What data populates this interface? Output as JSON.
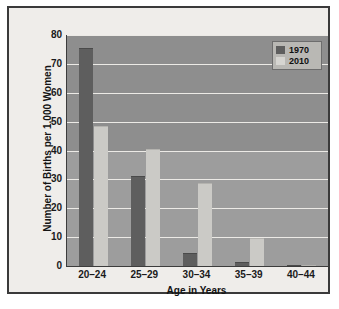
{
  "chart_data": {
    "type": "bar",
    "title": "",
    "xlabel": "Age in Years",
    "ylabel": "Number of Births per 1,000 Women",
    "categories": [
      "20–24",
      "25–29",
      "30–34",
      "35–39",
      "40–44"
    ],
    "series": [
      {
        "name": "1970",
        "color": "#5e5e5e",
        "values": [
          75.5,
          31.2,
          4.5,
          1.3,
          0.2
        ]
      },
      {
        "name": "2010",
        "color": "#cbcac6",
        "values": [
          48.5,
          40.5,
          28.8,
          9.7,
          0.5
        ]
      }
    ],
    "ylim": [
      0,
      80
    ],
    "y_ticks": [
      0,
      10,
      20,
      30,
      40,
      50,
      60,
      70,
      80
    ],
    "y_tick_labels": [
      "0",
      "10",
      "20",
      "30",
      "40",
      "50",
      "60",
      "70",
      "80"
    ],
    "grid": true,
    "grid_color": "#eceae6",
    "legend_position": "top-right",
    "plot_background": "#979797",
    "figure_background": "#efedea",
    "frame_color": "#3a3a3a"
  },
  "legend": {
    "entries": [
      {
        "label": "1970",
        "swatch": "dark-gray"
      },
      {
        "label": "2010",
        "swatch": "light-gray"
      }
    ]
  },
  "axes": {
    "y_title": "Number of Births per 1,000 Women",
    "x_title": "Age in Years"
  }
}
